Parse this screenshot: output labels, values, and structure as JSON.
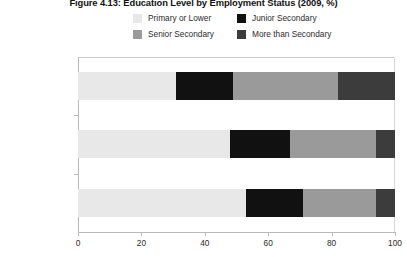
{
  "chart_data": {
    "type": "bar",
    "orientation": "horizontal",
    "stacked": true,
    "title": "Figure 4.13: Education Level by Employment Status (2009, %)",
    "xlabel": "",
    "ylabel": "",
    "xlim": [
      0,
      100
    ],
    "xticks": [
      "0",
      "20",
      "40",
      "60",
      "80",
      "100"
    ],
    "xtick_values": [
      0,
      20,
      40,
      60,
      80,
      100
    ],
    "grid": false,
    "legend_position": "top",
    "categories": [
      "Formal Sector",
      "Not Underemployed",
      "Employed"
    ],
    "category_labels": [
      {
        "text": "Formal Sector",
        "footnote": ""
      },
      {
        "text": "Not Underemployed",
        "footnote": "a"
      },
      {
        "text": "Employed",
        "footnote": ""
      }
    ],
    "series": [
      {
        "name": "Primary or Lower",
        "color": "#e8e8e8",
        "values": [
          31,
          48,
          53
        ]
      },
      {
        "name": "Junior Secondary",
        "color": "#111111",
        "values": [
          18,
          19,
          18
        ]
      },
      {
        "name": "Senior Secondary",
        "color": "#9a9a9a",
        "values": [
          33,
          27,
          23
        ]
      },
      {
        "name": "More than Secondary",
        "color": "#3c3c3c",
        "values": [
          18,
          6,
          6
        ]
      }
    ]
  },
  "legend": {
    "items": [
      {
        "label": "Primary or Lower",
        "color": "#e8e8e8"
      },
      {
        "label": "Junior Secondary",
        "color": "#111111"
      },
      {
        "label": "Senior Secondary",
        "color": "#9a9a9a"
      },
      {
        "label": "More than Secondary",
        "color": "#3c3c3c"
      }
    ]
  },
  "colors": {
    "axis": "#b9b9b9",
    "frame": "#c9c9c9",
    "text": "#2b2b2b",
    "title": "#121212",
    "background": "#ffffff"
  }
}
